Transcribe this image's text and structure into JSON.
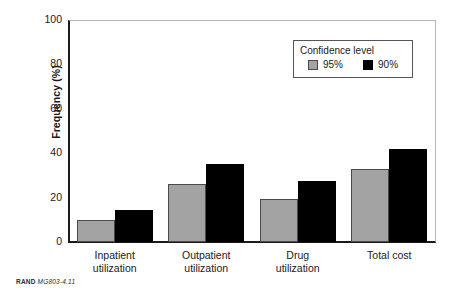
{
  "chart_data": {
    "type": "bar",
    "title": "",
    "xlabel": "",
    "ylabel": "Frequency (%)",
    "ylim": [
      0,
      100
    ],
    "yticks": [
      0,
      20,
      40,
      60,
      80,
      100
    ],
    "ytick_labels": [
      "0",
      "20",
      "40",
      "60",
      "80",
      "100"
    ],
    "grid": false,
    "legend_position": "top-right",
    "legend_title": "Confidence level",
    "categories": [
      "Inpatient\nutilization",
      "Outpatient\nutilization",
      "Drug\nutilization",
      "Total cost"
    ],
    "category_lines": [
      [
        "Inpatient",
        "utilization"
      ],
      [
        "Outpatient",
        "utilization"
      ],
      [
        "Drug",
        "utilization"
      ],
      [
        "Total cost"
      ]
    ],
    "series": [
      {
        "name": "95%",
        "color": "#a3a3a3",
        "values": [
          10,
          26,
          19.5,
          33
        ]
      },
      {
        "name": "90%",
        "color": "#000000",
        "values": [
          14.5,
          35,
          27.5,
          42
        ]
      }
    ]
  },
  "legend": {
    "title": "Confidence level",
    "entries": [
      {
        "label": "95%",
        "swatch": "gray-swatch"
      },
      {
        "label": "90%",
        "swatch": "black-swatch"
      }
    ]
  },
  "axes": {
    "y_title": "Frequency (%)"
  },
  "footer": {
    "brand": "RAND",
    "code": "MG803-4.11"
  },
  "colors": {
    "series_95": "#a3a3a3",
    "series_90": "#000000",
    "axis": "#1a1a1a",
    "frame": "#b5b5b5",
    "background": "#ffffff"
  }
}
